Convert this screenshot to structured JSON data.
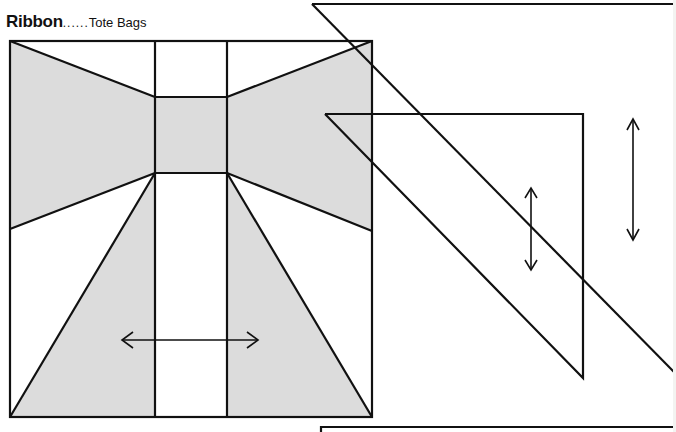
{
  "title": {
    "main": "Ribbon",
    "separator": "......",
    "subtitle": "Tote Bags"
  },
  "colors": {
    "line": "#111111",
    "fill": "#dcdcdc",
    "background": "#ffffff"
  },
  "block": {
    "outer_square": {
      "x": 10,
      "y": 41,
      "w": 362,
      "h": 376
    },
    "center_strip": {
      "x1": 155,
      "x2": 227
    },
    "knot": {
      "x": 155,
      "y": 97,
      "w": 72,
      "h": 76
    },
    "pieces": [
      {
        "name": "left-bow",
        "shaded": true
      },
      {
        "name": "right-bow",
        "shaded": true
      },
      {
        "name": "knot",
        "shaded": true
      },
      {
        "name": "left-tail",
        "shaded": true
      },
      {
        "name": "right-tail",
        "shaded": true
      }
    ],
    "grain_arrow": {
      "orientation": "horizontal",
      "x1": 122,
      "x2": 258,
      "y": 340
    }
  },
  "templates": {
    "large_triangle": {
      "grain_arrow": {
        "orientation": "vertical",
        "x": 633,
        "y1": 119,
        "y2": 240
      }
    },
    "small_triangle": {
      "grain_arrow": {
        "orientation": "vertical",
        "x": 531,
        "y1": 188,
        "y2": 270
      }
    },
    "bottom_rectangle": {
      "x": 321,
      "y": 427
    }
  }
}
